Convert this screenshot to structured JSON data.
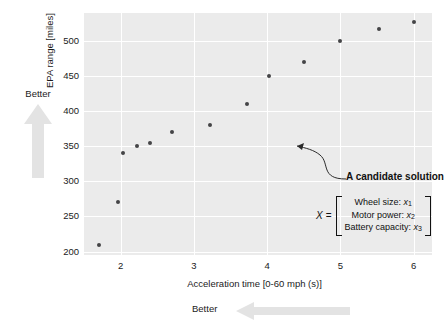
{
  "chart_data": {
    "type": "scatter",
    "title": "",
    "xlabel": "Acceleration time [0-60 mph (s)]",
    "ylabel": "EPA range [miles]",
    "xlim": [
      1.5,
      6.25
    ],
    "ylim": [
      195,
      540
    ],
    "grid": true,
    "legend": null,
    "xticks": [
      2,
      3,
      4,
      5,
      6
    ],
    "xtick_labels": [
      "2",
      "3",
      "4",
      "5",
      "6"
    ],
    "yticks": [
      200,
      250,
      300,
      350,
      400,
      450,
      500
    ],
    "ytick_labels": [
      "200",
      "250",
      "300",
      "350",
      "400",
      "450",
      "500"
    ],
    "x": [
      1.7,
      1.97,
      2.03,
      2.22,
      2.4,
      2.7,
      3.22,
      3.72,
      4.02,
      4.5,
      5.0,
      5.52,
      6.0
    ],
    "y": [
      210,
      270,
      340,
      350,
      355,
      370,
      380,
      410,
      450,
      470,
      500,
      517,
      527
    ],
    "points": [
      {
        "x": 1.7,
        "y": 210
      },
      {
        "x": 1.97,
        "y": 270
      },
      {
        "x": 2.03,
        "y": 340
      },
      {
        "x": 2.22,
        "y": 350
      },
      {
        "x": 2.4,
        "y": 355
      },
      {
        "x": 2.7,
        "y": 370
      },
      {
        "x": 3.22,
        "y": 380
      },
      {
        "x": 3.72,
        "y": 410
      },
      {
        "x": 4.02,
        "y": 450
      },
      {
        "x": 4.5,
        "y": 470
      },
      {
        "x": 5.0,
        "y": 500
      },
      {
        "x": 5.52,
        "y": 517
      },
      {
        "x": 6.0,
        "y": 527
      }
    ],
    "marker_color": "#444446",
    "plot_background": "#ebebeb",
    "gridline_color": "#ffffff",
    "annotations": [
      {
        "text": "A candidate solution",
        "target_point": {
          "x": 3.22,
          "y": 380
        },
        "style": "bold-curved-leader"
      }
    ]
  },
  "axes": {
    "y_title": "EPA range [miles]",
    "x_title": "Acceleration time [0-60 mph (s)]"
  },
  "direction_hints": {
    "vertical": {
      "label": "Better",
      "direction": "up"
    },
    "horizontal": {
      "label": "Better",
      "direction": "left"
    },
    "arrow_color": "#e0e0e0"
  },
  "annotation": {
    "label": "A candidate solution"
  },
  "matrix": {
    "variable": "X",
    "equals": "=",
    "rows": [
      {
        "name": "Wheel size:",
        "var": "x",
        "sub": "1"
      },
      {
        "name": "Motor power:",
        "var": "x",
        "sub": "2"
      },
      {
        "name": "Battery capacity:",
        "var": "x",
        "sub": "3"
      }
    ]
  }
}
